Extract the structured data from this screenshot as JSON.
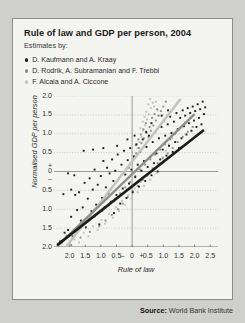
{
  "figure": {
    "title": "Rule of law and GDP per person, 2004",
    "subtitle": "Estimates by:"
  },
  "source": {
    "label": "Source:",
    "value": "World Bank Institute"
  },
  "chart_data": {
    "type": "scatter",
    "title": "Rule of law and GDP per person, 2004",
    "subtitle": "Estimates by:",
    "xlabel": "Rule of law",
    "ylabel": "Normalised GDP per person",
    "xlim": [
      -2.5,
      2.75
    ],
    "ylim": [
      -2.0,
      2.0
    ],
    "grid": true,
    "grid_axis": "y",
    "legend_position": "above-plot",
    "xticks": [
      -2.0,
      -1.5,
      -1.0,
      -0.5,
      0,
      0.5,
      1.0,
      1.5,
      2.0,
      2.5
    ],
    "xticklabels": [
      "2.0",
      "1.5",
      "1.0",
      "0.5",
      "0",
      "0.5",
      "1.0",
      "1.5",
      "2.0",
      "2.5"
    ],
    "xsign_minus": "–",
    "xsign_plus": "+",
    "yticks": [
      -2.0,
      -1.5,
      -1.0,
      -0.5,
      0,
      0.5,
      1.0,
      1.5,
      2.0
    ],
    "yticklabels": [
      "2.0",
      "1.5",
      "1.0",
      "0.5",
      "0",
      "0.5",
      "1.0",
      "1.5",
      "2.0"
    ],
    "ysign_plus": "+",
    "ysign_minus": "–",
    "colors": {
      "kaufmann": "#1c1c1c",
      "rodrik": "#8e8e8e",
      "alcala": "#c2c2c2",
      "grid": "#b6b6b2",
      "axis": "#8f8f8a",
      "panel": "#f4f4f1"
    },
    "series": [
      {
        "name": "D. Kaufmann and A. Kraay",
        "color": "#1c1c1c",
        "marker": "square",
        "trend": {
          "x0": -2.4,
          "y0": -1.95,
          "x1": 2.3,
          "y1": 1.1,
          "width": 2.6
        },
        "points": [
          [
            -2.3,
            -1.85
          ],
          [
            -2.16,
            -1.62
          ],
          [
            -2.05,
            -1.55
          ],
          [
            -1.95,
            -1.2
          ],
          [
            -1.9,
            -1.72
          ],
          [
            -1.82,
            -0.62
          ],
          [
            -1.76,
            -1.02
          ],
          [
            -1.7,
            -0.55
          ],
          [
            -1.64,
            -1.3
          ],
          [
            -1.58,
            -0.95
          ],
          [
            -1.52,
            -0.3
          ],
          [
            -1.48,
            -1.48
          ],
          [
            -1.42,
            -0.72
          ],
          [
            -1.36,
            -0.18
          ],
          [
            -1.3,
            -1.05
          ],
          [
            -1.26,
            -0.48
          ],
          [
            -1.2,
            0.05
          ],
          [
            -1.15,
            -0.88
          ],
          [
            -1.1,
            -0.35
          ],
          [
            -1.05,
            -1.4
          ],
          [
            -1.0,
            -0.12
          ],
          [
            -0.96,
            -0.7
          ],
          [
            -0.92,
            0.28
          ],
          [
            -0.88,
            -0.95
          ],
          [
            -0.84,
            -0.42
          ],
          [
            -0.8,
            0.1
          ],
          [
            -0.76,
            -0.58
          ],
          [
            -0.72,
            -0.05
          ],
          [
            -0.68,
            -0.8
          ],
          [
            -0.64,
            0.32
          ],
          [
            -0.6,
            -0.25
          ],
          [
            -0.58,
            -1.1
          ],
          [
            -0.54,
            0.02
          ],
          [
            -0.5,
            -0.62
          ],
          [
            -0.46,
            0.45
          ],
          [
            -0.42,
            -0.18
          ],
          [
            -0.38,
            -0.85
          ],
          [
            -0.34,
            0.18
          ],
          [
            -0.3,
            -0.45
          ],
          [
            -0.26,
            0.55
          ],
          [
            -0.22,
            -0.08
          ],
          [
            -0.18,
            -0.7
          ],
          [
            -0.14,
            0.3
          ],
          [
            -0.1,
            -0.32
          ],
          [
            -0.06,
            0.62
          ],
          [
            -0.02,
            0.05
          ],
          [
            0.02,
            -0.55
          ],
          [
            0.06,
            0.4
          ],
          [
            0.1,
            -0.15
          ],
          [
            0.14,
            0.72
          ],
          [
            0.18,
            0.18
          ],
          [
            0.22,
            -0.4
          ],
          [
            0.26,
            0.52
          ],
          [
            0.3,
            0.02
          ],
          [
            0.34,
            0.85
          ],
          [
            0.38,
            0.28
          ],
          [
            0.42,
            -0.25
          ],
          [
            0.46,
            0.65
          ],
          [
            0.5,
            0.12
          ],
          [
            0.54,
            0.95
          ],
          [
            0.58,
            0.38
          ],
          [
            0.62,
            -0.1
          ],
          [
            0.66,
            0.78
          ],
          [
            0.7,
            0.22
          ],
          [
            0.74,
            1.05
          ],
          [
            0.78,
            0.48
          ],
          [
            0.82,
            0.0
          ],
          [
            0.86,
            0.88
          ],
          [
            0.9,
            0.32
          ],
          [
            0.94,
            1.18
          ],
          [
            0.98,
            0.58
          ],
          [
            1.02,
            1.35
          ],
          [
            1.06,
            0.95
          ],
          [
            1.1,
            0.42
          ],
          [
            1.14,
            1.25
          ],
          [
            1.18,
            0.68
          ],
          [
            1.22,
            1.45
          ],
          [
            1.26,
            1.02
          ],
          [
            1.3,
            0.52
          ],
          [
            1.34,
            1.32
          ],
          [
            1.38,
            0.78
          ],
          [
            1.42,
            1.55
          ],
          [
            1.46,
            1.12
          ],
          [
            1.5,
            0.62
          ],
          [
            1.54,
            1.42
          ],
          [
            1.58,
            0.88
          ],
          [
            1.62,
            1.62
          ],
          [
            1.66,
            1.2
          ],
          [
            1.7,
            1.48
          ],
          [
            1.74,
            0.98
          ],
          [
            1.78,
            1.68
          ],
          [
            1.82,
            1.28
          ],
          [
            1.86,
            1.55
          ],
          [
            1.9,
            1.08
          ],
          [
            1.94,
            1.72
          ],
          [
            1.98,
            1.35
          ],
          [
            2.02,
            1.6
          ],
          [
            2.06,
            1.18
          ],
          [
            2.1,
            1.78
          ],
          [
            2.14,
            1.42
          ],
          [
            2.18,
            1.65
          ],
          [
            2.22,
            1.25
          ],
          [
            2.26,
            1.85
          ],
          [
            2.3,
            1.52
          ],
          [
            2.34,
            1.7
          ],
          [
            -0.48,
            0.68
          ],
          [
            -0.92,
            0.62
          ],
          [
            -1.25,
            0.58
          ],
          [
            -1.55,
            0.55
          ],
          [
            -1.85,
            -0.1
          ],
          [
            -2.05,
            -0.05
          ],
          [
            -2.2,
            -0.6
          ],
          [
            -1.95,
            -0.48
          ],
          [
            0.08,
            0.95
          ],
          [
            0.45,
            1.05
          ],
          [
            -0.15,
            0.85
          ],
          [
            0.62,
            1.28
          ],
          [
            0.95,
            1.48
          ],
          [
            1.15,
            1.62
          ]
        ]
      },
      {
        "name": "D. Rodrik, A. Subramanian and F. Trebbi",
        "color": "#8e8e8e",
        "marker": "square",
        "trend": {
          "x0": -2.4,
          "y0": -1.98,
          "x1": 2.0,
          "y1": 1.52,
          "width": 2.4
        },
        "points": [
          [
            -2.25,
            -1.9
          ],
          [
            -2.1,
            -1.7
          ],
          [
            -1.95,
            -1.95
          ],
          [
            -1.8,
            -1.55
          ],
          [
            -1.65,
            -1.75
          ],
          [
            -1.5,
            -1.35
          ],
          [
            -1.35,
            -1.6
          ],
          [
            -1.2,
            -1.2
          ],
          [
            -1.05,
            -1.45
          ],
          [
            -0.95,
            -1.05
          ],
          [
            -0.85,
            -1.3
          ],
          [
            -0.75,
            -0.9
          ],
          [
            -0.65,
            -1.15
          ],
          [
            -0.55,
            -0.72
          ],
          [
            -0.45,
            -1.0
          ],
          [
            -0.38,
            -0.58
          ],
          [
            -0.3,
            -0.85
          ],
          [
            -0.22,
            -0.42
          ],
          [
            -0.14,
            -0.68
          ],
          [
            -0.06,
            -0.28
          ],
          [
            0.02,
            -0.52
          ],
          [
            0.1,
            -0.12
          ],
          [
            0.18,
            -0.38
          ],
          [
            0.26,
            0.05
          ],
          [
            0.34,
            -0.22
          ],
          [
            0.42,
            0.18
          ],
          [
            0.5,
            -0.08
          ],
          [
            0.58,
            0.32
          ],
          [
            0.66,
            0.08
          ],
          [
            0.74,
            0.45
          ],
          [
            0.82,
            0.22
          ],
          [
            0.9,
            0.58
          ],
          [
            0.98,
            0.35
          ],
          [
            1.06,
            0.72
          ],
          [
            1.14,
            0.48
          ],
          [
            1.22,
            0.85
          ],
          [
            1.3,
            0.62
          ],
          [
            1.38,
            1.0
          ],
          [
            1.46,
            0.78
          ],
          [
            1.54,
            1.15
          ],
          [
            1.62,
            0.92
          ],
          [
            1.7,
            1.28
          ],
          [
            1.78,
            1.05
          ],
          [
            1.86,
            1.42
          ],
          [
            1.94,
            1.18
          ],
          [
            0.52,
            0.92
          ],
          [
            0.6,
            1.08
          ],
          [
            0.68,
            1.22
          ],
          [
            0.76,
            1.35
          ],
          [
            0.84,
            1.48
          ],
          [
            0.92,
            1.6
          ],
          [
            1.0,
            1.72
          ],
          [
            1.08,
            1.85
          ],
          [
            0.46,
            1.02
          ],
          [
            0.38,
            0.88
          ],
          [
            0.3,
            0.75
          ],
          [
            0.22,
            0.62
          ],
          [
            0.14,
            0.48
          ],
          [
            0.06,
            0.35
          ],
          [
            -0.02,
            0.22
          ],
          [
            -0.1,
            0.1
          ],
          [
            0.56,
            1.18
          ],
          [
            0.64,
            1.42
          ],
          [
            0.72,
            1.52
          ],
          [
            0.8,
            1.65
          ],
          [
            0.44,
            1.28
          ],
          [
            0.36,
            1.12
          ],
          [
            0.28,
            0.98
          ],
          [
            0.2,
            0.85
          ],
          [
            0.12,
            0.7
          ]
        ]
      },
      {
        "name": "F. Alcala and A. Ciccone",
        "color": "#c2c2c2",
        "marker": "square",
        "trend": {
          "x0": -2.1,
          "y0": -1.98,
          "x1": 1.55,
          "y1": 1.92,
          "width": 2.4
        },
        "points": [
          [
            -2.0,
            -1.92
          ],
          [
            -1.85,
            -1.8
          ],
          [
            -1.7,
            -1.88
          ],
          [
            -1.55,
            -1.62
          ],
          [
            -1.4,
            -1.72
          ],
          [
            -1.25,
            -1.45
          ],
          [
            -1.1,
            -1.55
          ],
          [
            -0.98,
            -1.28
          ],
          [
            -0.86,
            -1.38
          ],
          [
            -0.74,
            -1.12
          ],
          [
            -0.62,
            -1.22
          ],
          [
            -0.52,
            -0.95
          ],
          [
            -0.42,
            -1.05
          ],
          [
            -0.32,
            -0.78
          ],
          [
            -0.22,
            -0.88
          ],
          [
            -0.12,
            -0.62
          ],
          [
            -0.02,
            -0.72
          ],
          [
            0.08,
            -0.45
          ],
          [
            0.18,
            -0.55
          ],
          [
            0.28,
            -0.28
          ],
          [
            0.38,
            -0.38
          ],
          [
            0.48,
            -0.12
          ],
          [
            0.58,
            -0.22
          ],
          [
            0.68,
            0.05
          ],
          [
            0.78,
            -0.05
          ],
          [
            0.88,
            0.22
          ],
          [
            0.98,
            0.38
          ],
          [
            1.08,
            0.55
          ],
          [
            1.18,
            0.72
          ],
          [
            1.28,
            0.88
          ],
          [
            0.3,
            0.92
          ],
          [
            0.36,
            1.08
          ],
          [
            0.42,
            1.22
          ],
          [
            0.48,
            1.38
          ],
          [
            0.54,
            1.52
          ],
          [
            0.6,
            1.68
          ],
          [
            0.66,
            1.82
          ],
          [
            0.24,
            0.78
          ],
          [
            0.18,
            0.62
          ],
          [
            0.12,
            0.48
          ],
          [
            0.7,
            1.72
          ],
          [
            0.76,
            1.85
          ],
          [
            0.82,
            1.62
          ],
          [
            0.88,
            1.48
          ],
          [
            0.34,
            1.32
          ],
          [
            0.4,
            1.45
          ],
          [
            0.46,
            1.58
          ],
          [
            0.52,
            1.78
          ],
          [
            0.58,
            1.92
          ],
          [
            0.26,
            1.15
          ]
        ]
      }
    ],
    "legend": [
      {
        "label": "D. Kaufmann and A. Kraay",
        "color": "#1c1c1c"
      },
      {
        "label": "D. Rodrik, A. Subramanian and F. Trebbi",
        "color": "#8e8e8e"
      },
      {
        "label": "F. Alcala and A. Ciccone",
        "color": "#c2c2c2"
      }
    ]
  }
}
